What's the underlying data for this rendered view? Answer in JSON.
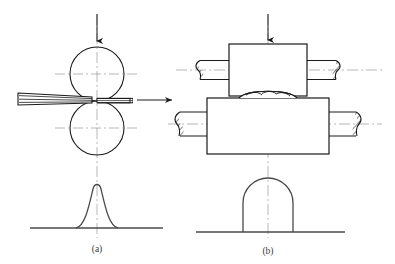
{
  "figure": {
    "caption_a": "(a)",
    "caption_b": "(b)",
    "background_color": "#ffffff",
    "line_color": "#1a1a1a",
    "centerline_color": "#8a8a8a",
    "curve_color": "#4a4a4a",
    "baseline_color": "#4a4a4a"
  },
  "panel_a": {
    "name": "side-view-rolling-pass",
    "top_roll": {
      "shape": "circle",
      "cx": 97,
      "cy": 74,
      "r": 27
    },
    "bottom_roll": {
      "shape": "circle",
      "cx": 97,
      "cy": 128,
      "r": 27
    },
    "workpiece_entry": {
      "label": "thick-strip",
      "x": 18,
      "y": 93,
      "width": 78,
      "height": 12
    },
    "workpiece_exit": {
      "label": "thin-strip",
      "x": 97,
      "y": 98,
      "width": 33,
      "height": 5
    },
    "load_arrow": {
      "direction": "down",
      "x": 97,
      "y_start": 14,
      "y_end": 47
    },
    "vertical_centerline": {
      "x": 97,
      "y_start": 14,
      "y_end": 238
    },
    "top_roll_centerline": {
      "y": 74,
      "x_start": 55,
      "x_end": 139
    },
    "bottom_roll_centerline": {
      "y": 128,
      "x_start": 55,
      "x_end": 139
    },
    "profile_curve": {
      "type": "bell-peak",
      "peak_x": 97,
      "peak_y": 185,
      "base_y": 228,
      "half_width": 22
    },
    "baseline": {
      "y": 228,
      "x_start": 30,
      "x_end": 163
    }
  },
  "transition_arrow": {
    "name": "process-flow-arrow",
    "direction": "right",
    "x_start": 136,
    "x_end": 176,
    "y": 100
  },
  "panel_b": {
    "name": "front-view-roll-stand",
    "top_roll_body": {
      "x": 229,
      "y": 44,
      "width": 78,
      "height": 52
    },
    "bottom_roll_body": {
      "x": 207,
      "y": 98,
      "width": 122,
      "height": 56
    },
    "top_shaft_left": {
      "x": 196,
      "y": 60,
      "width": 33,
      "height": 20
    },
    "top_shaft_right": {
      "x": 307,
      "y": 60,
      "width": 33,
      "height": 20
    },
    "bottom_shaft_left": {
      "x": 175,
      "y": 112,
      "width": 32,
      "height": 24
    },
    "bottom_shaft_right": {
      "x": 329,
      "y": 112,
      "width": 32,
      "height": 24
    },
    "workpiece": {
      "label": "rolled-bar-section",
      "cx": 268,
      "cy": 96,
      "width": 58,
      "height": 8
    },
    "load_arrow": {
      "direction": "down",
      "x": 268,
      "y_start": 14,
      "y_end": 44
    },
    "vertical_centerline": {
      "x": 268,
      "y_start": 14,
      "y_end": 238
    },
    "top_shaft_centerline": {
      "y": 70,
      "x_start": 176,
      "x_end": 382
    },
    "bottom_shaft_centerline": {
      "y": 124,
      "x_start": 168,
      "x_end": 382
    },
    "profile_shape": {
      "type": "rounded-top-rectangle",
      "cx": 268,
      "base_y": 232,
      "width": 50,
      "height": 54,
      "corner_radius": 25
    },
    "baseline": {
      "y": 232,
      "x_start": 196,
      "x_end": 345
    }
  }
}
